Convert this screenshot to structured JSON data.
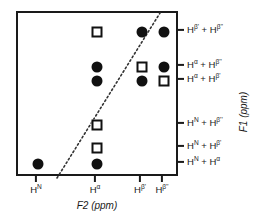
{
  "figure": {
    "type": "scatter",
    "axis_titles": {
      "x": "F2 (ppm)",
      "y": "F1 (ppm)"
    },
    "frame": {
      "left": 16,
      "top": 11,
      "width": 162,
      "height": 165
    },
    "colors": {
      "marker_fill": "#111111",
      "frame": "#1a1a1a",
      "diagonal": "#333333"
    },
    "x_axis": {
      "ticks": [
        {
          "label_html": "H<sup>N</sup>",
          "text": "HN",
          "x": 36
        },
        {
          "label_html": "H<sup>α</sup>",
          "text": "Hα",
          "x": 95
        },
        {
          "label_html": "H<sup>β'</sup>",
          "text": "Hβ'",
          "x": 140
        },
        {
          "label_html": "H<sup>β''</sup>",
          "text": "Hβ''",
          "x": 162
        }
      ]
    },
    "y_axis": {
      "ticks": [
        {
          "label_html": "H<sup>β'</sup> + H<sup>β''</sup>",
          "text": "Hβ' + Hβ''",
          "y": 30
        },
        {
          "label_html": "H<sup>α</sup> + H<sup>β''</sup>",
          "text": "Hα + Hβ''",
          "y": 65
        },
        {
          "label_html": "H<sup>α</sup> + H<sup>β'</sup>",
          "text": "Hα + Hβ'",
          "y": 79
        },
        {
          "label_html": "H<sup>N</sup> + H<sup>β''</sup>",
          "text": "HN + Hβ''",
          "y": 123
        },
        {
          "label_html": "H<sup>N</sup> + H<sup>β'</sup>",
          "text": "HN + Hβ'",
          "y": 146
        },
        {
          "label_html": "H<sup>N</sup> + H<sup>α</sup>",
          "text": "HN + Hα",
          "y": 162
        }
      ]
    },
    "diagonal": {
      "x1": 55,
      "y1": 176,
      "x2": 158,
      "y2": 11
    },
    "markers": [
      {
        "shape": "square",
        "x": 95,
        "y": 30,
        "xcat": "Hα",
        "ycat": "Hβ' + Hβ''"
      },
      {
        "shape": "circle",
        "x": 140,
        "y": 30,
        "xcat": "Hβ'",
        "ycat": "Hβ' + Hβ''"
      },
      {
        "shape": "circle",
        "x": 162,
        "y": 30,
        "xcat": "Hβ''",
        "ycat": "Hβ' + Hβ''"
      },
      {
        "shape": "circle",
        "x": 95,
        "y": 65,
        "xcat": "Hα",
        "ycat": "Hα + Hβ''"
      },
      {
        "shape": "square",
        "x": 140,
        "y": 65,
        "xcat": "Hβ'",
        "ycat": "Hα + Hβ''"
      },
      {
        "shape": "circle",
        "x": 162,
        "y": 65,
        "xcat": "Hβ''",
        "ycat": "Hα + Hβ''"
      },
      {
        "shape": "circle",
        "x": 95,
        "y": 79,
        "xcat": "Hα",
        "ycat": "Hα + Hβ'"
      },
      {
        "shape": "circle",
        "x": 140,
        "y": 79,
        "xcat": "Hβ'",
        "ycat": "Hα + Hβ'"
      },
      {
        "shape": "square",
        "x": 162,
        "y": 79,
        "xcat": "Hβ''",
        "ycat": "Hα + Hβ'"
      },
      {
        "shape": "square",
        "x": 95,
        "y": 123,
        "xcat": "Hα",
        "ycat": "HN + Hβ''"
      },
      {
        "shape": "square",
        "x": 95,
        "y": 146,
        "xcat": "Hα",
        "ycat": "HN + Hβ'"
      },
      {
        "shape": "circle",
        "x": 95,
        "y": 162,
        "xcat": "Hα",
        "ycat": "HN + Hα"
      },
      {
        "shape": "circle",
        "x": 36,
        "y": 162,
        "xcat": "HN",
        "ycat": "HN + Hα"
      }
    ]
  }
}
